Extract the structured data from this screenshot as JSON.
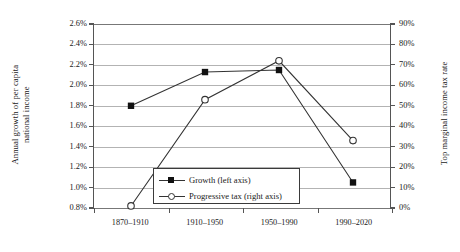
{
  "chart_data": {
    "type": "line",
    "title": "",
    "categories": [
      "1870–1910",
      "1910–1950",
      "1950–1990",
      "1990–2020"
    ],
    "series": [
      {
        "name": "Growth (left axis)",
        "axis": "left",
        "marker": "filled-square",
        "values": [
          1.8,
          2.13,
          2.15,
          1.05
        ]
      },
      {
        "name": "Progressive tax (right axis)",
        "axis": "right",
        "marker": "open-circle",
        "values": [
          1,
          53,
          72,
          33
        ]
      }
    ],
    "left_axis": {
      "label_line1": "Annual growth of per capita",
      "label_line2": "national income",
      "ticks": [
        "0.8%",
        "1.0%",
        "1.2%",
        "1.4%",
        "1.6%",
        "1.8%",
        "2.0%",
        "2.2%",
        "2.4%",
        "2.6%"
      ],
      "tick_values": [
        0.8,
        1.0,
        1.2,
        1.4,
        1.6,
        1.8,
        2.0,
        2.2,
        2.4,
        2.6
      ],
      "ylim": [
        0.8,
        2.6
      ]
    },
    "right_axis": {
      "label": "Top marginal income tax rate",
      "ticks": [
        "0%",
        "10%",
        "20%",
        "30%",
        "40%",
        "50%",
        "60%",
        "70%",
        "80%",
        "90%"
      ],
      "tick_values": [
        0,
        10,
        20,
        30,
        40,
        50,
        60,
        70,
        80,
        90
      ],
      "ylim": [
        0,
        90
      ]
    },
    "xlabel": "",
    "grid": true,
    "legend_position": "inside-bottom-center",
    "colors": {
      "line": "#333333",
      "grid": "#b3b3b3",
      "axis": "#555555",
      "marker_fill": "#111111",
      "background": "#ffffff"
    }
  },
  "legend": {
    "entries": [
      {
        "label": "Growth (left axis)"
      },
      {
        "label": "Progressive tax (right axis)"
      }
    ]
  }
}
